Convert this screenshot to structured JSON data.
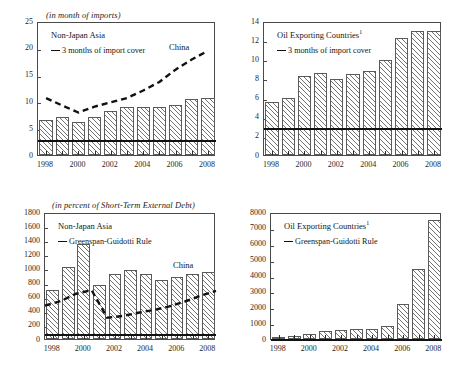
{
  "figure": {
    "panels": [
      {
        "id": "top-left",
        "unit_title": "(in month of imports)",
        "region_label": "Non-Japan Asia",
        "legend_label": "3 months of import cover",
        "line_label": "China",
        "footnote_marker": ""
      },
      {
        "id": "top-right",
        "unit_title": "",
        "region_label": "Oil Exporting Countries",
        "legend_label": "3 months of import cover",
        "line_label": "",
        "footnote_marker": "1"
      },
      {
        "id": "bottom-left",
        "unit_title": "(in percent of Short-Term External Debt)",
        "region_label": "Non-Japan Asia",
        "legend_label": "Greenspan-Guidotti Rule",
        "line_label": "China",
        "footnote_marker": ""
      },
      {
        "id": "bottom-right",
        "unit_title": "",
        "region_label": "Oil Exporting Countries",
        "legend_label": "Greenspan-Guidotti Rule",
        "line_label": "",
        "footnote_marker": "1"
      }
    ]
  },
  "chart_data": [
    {
      "type": "bar",
      "panel": "top-left",
      "title": "Non-Japan Asia",
      "subtitle": "(in month of imports)",
      "xlabel": "",
      "ylabel": "",
      "ylim": [
        0,
        25
      ],
      "yticks": [
        0,
        5,
        10,
        15,
        20,
        25
      ],
      "ytick_labels": [
        "0",
        "5",
        "10",
        "15",
        "20",
        "25"
      ],
      "x": [
        1998,
        1999,
        2000,
        2001,
        2002,
        2003,
        2004,
        2005,
        2006,
        2007,
        2008
      ],
      "xtick_labels": [
        "1998",
        "",
        "2000",
        "",
        "2002",
        "",
        "2004",
        "",
        "2006",
        "",
        "2008"
      ],
      "categories": [
        "1998",
        "1999",
        "2000",
        "2001",
        "2002",
        "2003",
        "2004",
        "2005",
        "2006",
        "2007",
        "2008"
      ],
      "values": [
        6.6,
        7.0,
        6.1,
        7.1,
        8.2,
        8.9,
        9.0,
        8.9,
        9.3,
        10.4,
        10.7
      ],
      "series": [
        {
          "name": "China",
          "style": "dashed-line",
          "values": [
            11.0,
            9.6,
            8.3,
            9.4,
            10.2,
            11.0,
            12.4,
            14.0,
            16.3,
            18.2,
            19.8
          ]
        }
      ],
      "reference_line": {
        "label": "3 months of import cover",
        "value": 3.1,
        "style": "solid"
      },
      "grid": false,
      "legend_position": "upper-left"
    },
    {
      "type": "bar",
      "panel": "top-right",
      "title": "Oil Exporting Countries",
      "subtitle": "",
      "footnote": "1",
      "xlabel": "",
      "ylabel": "",
      "ylim": [
        0,
        14
      ],
      "yticks": [
        0,
        2,
        4,
        6,
        8,
        10,
        12,
        14
      ],
      "ytick_labels": [
        "0",
        "2",
        "4",
        "6",
        "8",
        "10",
        "12",
        "14"
      ],
      "x": [
        1998,
        1999,
        2000,
        2001,
        2002,
        2003,
        2004,
        2005,
        2006,
        2007,
        2008
      ],
      "xtick_labels": [
        "1998",
        "",
        "2000",
        "",
        "2002",
        "",
        "2004",
        "",
        "2006",
        "",
        "2008"
      ],
      "categories": [
        "1998",
        "1999",
        "2000",
        "2001",
        "2002",
        "2003",
        "2004",
        "2005",
        "2006",
        "2007",
        "2008"
      ],
      "values": [
        5.55,
        6.0,
        8.25,
        8.55,
        7.95,
        8.5,
        8.75,
        9.95,
        12.25,
        13.0,
        12.95
      ],
      "reference_line": {
        "label": "3 months of import cover",
        "value": 3.05,
        "style": "solid"
      },
      "grid": false,
      "legend_position": "upper-left"
    },
    {
      "type": "bar",
      "panel": "bottom-left",
      "title": "Non-Japan Asia",
      "subtitle": "(in percent of Short-Term External Debt)",
      "xlabel": "",
      "ylabel": "",
      "ylim": [
        0,
        1800
      ],
      "yticks": [
        0,
        200,
        400,
        600,
        800,
        1000,
        1200,
        1400,
        1600,
        1800
      ],
      "ytick_labels": [
        "0",
        "200",
        "400",
        "600",
        "800",
        "1000",
        "1200",
        "1400",
        "1600",
        "1800"
      ],
      "x": [
        1998,
        1999,
        2000,
        2001,
        2002,
        2003,
        2004,
        2005,
        2006,
        2007,
        2008
      ],
      "xtick_labels": [
        "1998",
        "",
        "2000",
        "",
        "2002",
        "",
        "2004",
        "",
        "2006",
        "",
        "2008"
      ],
      "categories": [
        "1998",
        "1999",
        "2000",
        "2001",
        "2002",
        "2003",
        "2004",
        "2005",
        "2006",
        "2007",
        "2008"
      ],
      "values": [
        700,
        1020,
        1345,
        760,
        915,
        975,
        925,
        840,
        875,
        915,
        955
      ],
      "series": [
        {
          "name": "China",
          "style": "dashed-line",
          "values": [
            500,
            565,
            670,
            720,
            330,
            355,
            400,
            440,
            490,
            560,
            640,
            710
          ]
        }
      ],
      "reference_line": {
        "label": "Greenspan-Guidotti Rule",
        "value": 100,
        "style": "solid"
      },
      "grid": false,
      "legend_position": "upper-left"
    },
    {
      "type": "bar",
      "panel": "bottom-right",
      "title": "Oil Exporting Countries",
      "subtitle": "",
      "footnote": "1",
      "xlabel": "",
      "ylabel": "",
      "ylim": [
        0,
        8000
      ],
      "yticks": [
        0,
        1000,
        2000,
        3000,
        4000,
        5000,
        6000,
        7000,
        8000
      ],
      "ytick_labels": [
        "0",
        "1000",
        "2000",
        "3000",
        "4000",
        "5000",
        "6000",
        "7000",
        "8000"
      ],
      "x": [
        1998,
        1999,
        2000,
        2001,
        2002,
        2003,
        2004,
        2005,
        2006,
        2007,
        2008
      ],
      "xtick_labels": [
        "1998",
        "",
        "2000",
        "",
        "2002",
        "",
        "2004",
        "",
        "2006",
        "",
        "2008"
      ],
      "categories": [
        "1998",
        "1999",
        "2000",
        "2001",
        "2002",
        "2003",
        "2004",
        "2005",
        "2006",
        "2007",
        "2008"
      ],
      "values": [
        150,
        175,
        310,
        520,
        540,
        620,
        630,
        840,
        2230,
        4400,
        7500
      ],
      "reference_line": {
        "label": "Greenspan-Guidotti Rule",
        "value": 100,
        "style": "solid"
      },
      "grid": false,
      "legend_position": "upper-left"
    }
  ],
  "colors": {
    "axis": "#4a4a4a",
    "bar_edge": "#5a5a5a",
    "hatch": "#5a5a5a",
    "line": "#111111",
    "text": "#1f1f1f",
    "background": "#ffffff"
  }
}
